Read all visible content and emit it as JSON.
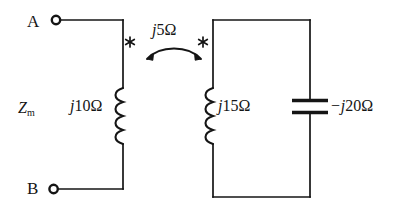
{
  "figure": {
    "type": "circuit-diagram",
    "background_color": "#ffffff",
    "line_color": "#151515"
  },
  "terminals": [
    {
      "name": "terminal-a",
      "label": "A",
      "marker": "open-circle-terminal"
    },
    {
      "name": "terminal-b",
      "label": "B",
      "marker": "open-circle-terminal"
    }
  ],
  "labels": {
    "input_impedance": {
      "symbol": "Z",
      "subscript": "m",
      "text": "Zm"
    },
    "primary_inductor": {
      "prefix": "j",
      "value": "10",
      "unit": "Ω",
      "text": "j10Ω"
    },
    "mutual_coupling": {
      "prefix": "j",
      "value": "5",
      "unit": "Ω",
      "text": "j5Ω"
    },
    "secondary_inductor": {
      "prefix": "j",
      "value": "15",
      "unit": "Ω",
      "text": "j15Ω"
    },
    "capacitor": {
      "prefix": "−j",
      "value": "20",
      "unit": "Ω",
      "text": "−j20Ω"
    }
  },
  "components": [
    {
      "name": "primary-inductor",
      "kind": "inductor",
      "orientation": "vertical",
      "loops": 4,
      "impedance": "j10Ω",
      "dot_marker": "asterisk"
    },
    {
      "name": "secondary-inductor",
      "kind": "inductor",
      "orientation": "vertical",
      "loops": 4,
      "impedance": "j15Ω",
      "dot_marker": "asterisk"
    },
    {
      "name": "capacitor",
      "kind": "capacitor",
      "orientation": "vertical",
      "plates": 2,
      "impedance": "−j20Ω"
    },
    {
      "name": "mutual-coupling-arrow",
      "kind": "double-headed-curved-arrow",
      "impedance": "j5Ω"
    }
  ],
  "markers": {
    "primary_dot": "*",
    "secondary_dot": "*"
  }
}
